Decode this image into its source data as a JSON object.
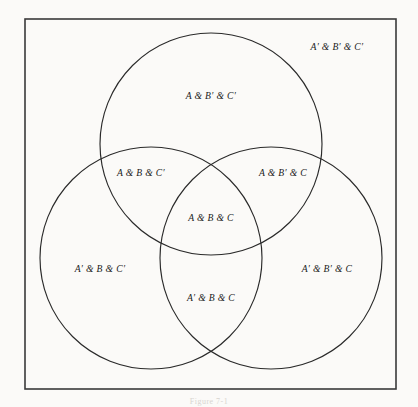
{
  "figure": {
    "caption": "Figure 7-1",
    "background_color": "#fbfaf8",
    "stroke_color": "#2a2a2a",
    "border_color": "#3a3a3a"
  },
  "universe": {
    "name": "universe-rectangle",
    "x": 25,
    "y": 19,
    "width": 371,
    "height": 370
  },
  "circles": [
    {
      "name": "circle-a",
      "set": "A",
      "cx": 211,
      "cy": 144,
      "r": 111
    },
    {
      "name": "circle-b",
      "set": "B",
      "cx": 151,
      "cy": 258,
      "r": 111
    },
    {
      "name": "circle-c",
      "set": "C",
      "cx": 271,
      "cy": 258,
      "r": 111
    }
  ],
  "regions": [
    {
      "id": "a-bp-cp",
      "label": "A & B′ & C′",
      "x": 211,
      "y": 97
    },
    {
      "id": "ap-bp-cp",
      "label": "A′ & B′ & C′",
      "x": 337,
      "y": 48
    },
    {
      "id": "a-b-cp",
      "label": "A & B & C′",
      "x": 141,
      "y": 174
    },
    {
      "id": "a-bp-c",
      "label": "A & B′ & C",
      "x": 283,
      "y": 174
    },
    {
      "id": "a-b-c",
      "label": "A & B & C",
      "x": 211,
      "y": 219
    },
    {
      "id": "ap-b-cp",
      "label": "A′ & B & C′",
      "x": 100,
      "y": 270
    },
    {
      "id": "ap-bp-c",
      "label": "A′ & B′ & C",
      "x": 327,
      "y": 270
    },
    {
      "id": "ap-b-c",
      "label": "A′ & B & C",
      "x": 211,
      "y": 299
    }
  ]
}
